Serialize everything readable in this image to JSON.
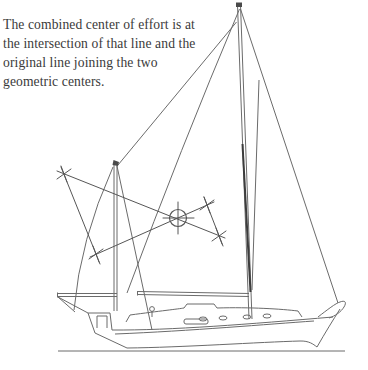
{
  "caption": {
    "lines": [
      "The combined center of effort is at",
      "the intersection of that line and the",
      "original line joining the two",
      "geometric centers."
    ]
  },
  "diagram": {
    "label": "sailboat-sail-plan-combined-center-of-effort",
    "background": "#ffffff",
    "ink_color": "#6b6b6b",
    "construction_color": "#565656",
    "text_color": "#3a3a3a",
    "center_of_effort": {
      "symbol": "circle-crosshair",
      "cx": 178,
      "cy": 218,
      "r": 8.5,
      "crosshair_h": [
        163,
        194
      ],
      "crosshair_v": [
        202,
        234
      ]
    },
    "construction_lines": [
      {
        "name": "ce-line-joining-centers",
        "x1": 57,
        "y1": 171,
        "x2": 225,
        "y2": 238
      },
      {
        "name": "ce-crossing-line",
        "x1": 90,
        "y1": 257,
        "x2": 214,
        "y2": 202
      },
      {
        "name": "left-offset-line",
        "x1": 61,
        "y1": 167,
        "x2": 100,
        "y2": 264
      },
      {
        "name": "right-offset-line",
        "x1": 204,
        "y1": 197,
        "x2": 223,
        "y2": 246
      }
    ],
    "x_marks": [
      {
        "name": "x-mark-upper-left",
        "x": 64,
        "y": 174
      },
      {
        "name": "x-mark-lower-left",
        "x": 96,
        "y": 254
      },
      {
        "name": "x-mark-upper-right",
        "x": 207,
        "y": 205
      },
      {
        "name": "x-mark-lower-right",
        "x": 219,
        "y": 236
      }
    ]
  }
}
